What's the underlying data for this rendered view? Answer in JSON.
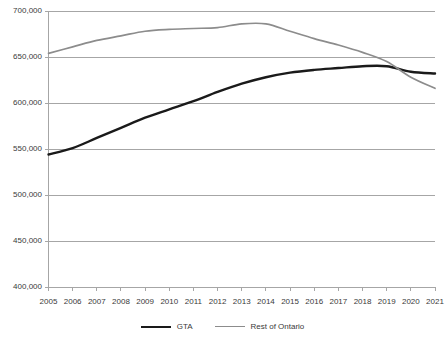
{
  "chart_data": {
    "type": "line",
    "title": "",
    "subtitle": "",
    "xlabel": "",
    "ylabel": "",
    "ylim": [
      400000,
      700000
    ],
    "ytick_step": 50000,
    "grid": true,
    "legend_position": "bottom",
    "x": [
      2005,
      2006,
      2007,
      2008,
      2009,
      2010,
      2011,
      2012,
      2013,
      2014,
      2015,
      2016,
      2017,
      2018,
      2019,
      2020,
      2021
    ],
    "categories": [
      "2005",
      "2006",
      "2007",
      "2008",
      "2009",
      "2010",
      "2011",
      "2012",
      "2013",
      "2014",
      "2015",
      "2016",
      "2017",
      "2018",
      "2019",
      "2020",
      "2021"
    ],
    "ytick_labels": [
      "700,000",
      "650,000",
      "600,000",
      "550,000",
      "500,000",
      "450,000",
      "400,000"
    ],
    "ytick_values": [
      700000,
      650000,
      600000,
      550000,
      500000,
      450000,
      400000
    ],
    "series": [
      {
        "name": "GTA",
        "color": "#1a1a1a",
        "values": [
          544000,
          551000,
          562000,
          573000,
          584000,
          593000,
          602000,
          612000,
          621000,
          628000,
          633000,
          636000,
          638000,
          640000,
          640000,
          634000,
          632000
        ]
      },
      {
        "name": "Rest of Ontario",
        "color": "#8c8c8c",
        "values": [
          654000,
          661000,
          668000,
          673000,
          678000,
          680000,
          681000,
          682000,
          686000,
          686000,
          678000,
          670000,
          663000,
          655000,
          645000,
          628000,
          616000
        ]
      }
    ],
    "legend": [
      {
        "label": "GTA",
        "color": "#1a1a1a"
      },
      {
        "label": "Rest of Ontario",
        "color": "#8c8c8c"
      }
    ],
    "colors": {
      "gta_line": "#1a1a1a",
      "rest_of_ontario_line": "#8c8c8c",
      "gridline": "#a6a6a6",
      "axis": "#a6a6a6",
      "text": "#3a3a3a",
      "background": "#ffffff"
    }
  }
}
